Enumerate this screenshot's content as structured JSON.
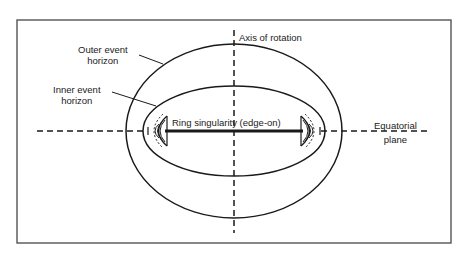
{
  "labels": {
    "outer_horizon": [
      "Outer event",
      "horizon"
    ],
    "inner_horizon": [
      "Inner event",
      "horizon"
    ],
    "axis": "Axis of rotation",
    "ring": "Ring singularity (edge-on)",
    "equatorial": [
      "Equatorial",
      "plane"
    ]
  },
  "colors": {
    "line": "#1a1a1a",
    "frame": "#555555",
    "background": "#ffffff"
  },
  "geometry": {
    "frame": {
      "x": 17,
      "y": 20,
      "w": 434,
      "h": 223
    },
    "center": {
      "x": 234,
      "y": 131
    },
    "outer_ellipse": {
      "rx": 108,
      "ry": 87
    },
    "inner_ellipse": {
      "rx": 91,
      "ry": 45
    },
    "ring_half_width": 70
  }
}
